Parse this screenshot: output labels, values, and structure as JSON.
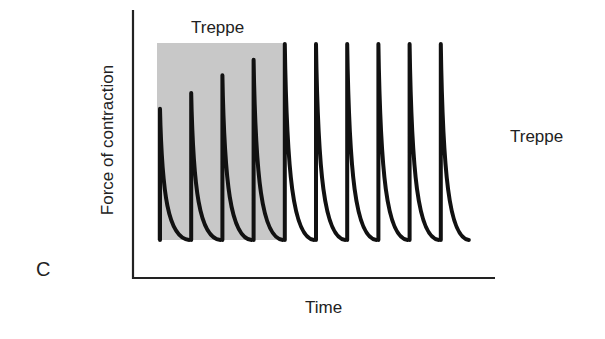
{
  "panel": {
    "label": "C"
  },
  "chart_data": {
    "type": "line",
    "title": "Treppe",
    "side_annotation": "Treppe",
    "xlabel": "Time",
    "ylabel": "Force of contraction",
    "grid": false,
    "legend": null,
    "shaded_region": {
      "label": "Treppe",
      "x_range": [
        1,
        5
      ],
      "color": "#c8c8c8"
    },
    "series": [
      {
        "name": "Twitch peak force",
        "x": [
          1,
          2,
          3,
          4,
          5,
          6,
          7,
          8,
          9,
          10
        ],
        "values": [
          0.67,
          0.75,
          0.84,
          0.92,
          1.0,
          1.0,
          1.0,
          1.0,
          1.0,
          1.0
        ]
      }
    ],
    "annotation": "Successive twitches increase in strength (staircase effect) until reaching a plateau",
    "colors": {
      "trace": "#111111",
      "shade": "#c8c8c8",
      "axis": "#222222"
    }
  }
}
